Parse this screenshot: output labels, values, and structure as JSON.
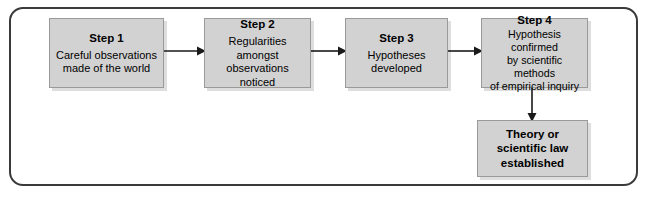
{
  "diagram": {
    "frame": {
      "style": "rounded-rectangle",
      "border_color": "#3a3a3a"
    },
    "box_fill_color": "#d2d2d2",
    "box_border_color": "#9a9a9a",
    "text_color": "#000000",
    "arrow_color": "#1a1a1a",
    "boxes": [
      {
        "id": "step-1",
        "title": "Step 1",
        "body": "Careful observations\nmade of the world"
      },
      {
        "id": "step-2",
        "title": "Step 2",
        "body": "Regularities amongst\nobservations noticed"
      },
      {
        "id": "step-3",
        "title": "Step 3",
        "body": "Hypotheses\ndeveloped"
      },
      {
        "id": "step-4",
        "title": "Step 4",
        "body": "Hypothesis confirmed\nby scientific methods\nof empirical inquiry"
      },
      {
        "id": "theory",
        "title": "",
        "body": "Theory or\nscientific law\nestablished"
      }
    ],
    "connectors": [
      {
        "id": "arrow-1-2",
        "from": "step-1",
        "to": "step-2",
        "direction": "right"
      },
      {
        "id": "arrow-2-3",
        "from": "step-2",
        "to": "step-3",
        "direction": "right"
      },
      {
        "id": "arrow-3-4",
        "from": "step-3",
        "to": "step-4",
        "direction": "right"
      },
      {
        "id": "arrow-4-theory",
        "from": "step-4",
        "to": "theory",
        "direction": "down"
      }
    ]
  }
}
